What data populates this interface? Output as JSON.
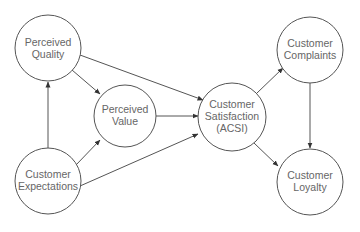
{
  "diagram": {
    "nodes": [
      {
        "id": "perceived_quality",
        "lines": [
          "Perceived",
          "Quality"
        ]
      },
      {
        "id": "perceived_value",
        "lines": [
          "Perceived",
          "Value"
        ]
      },
      {
        "id": "customer_expectations",
        "lines": [
          "Customer",
          "Expectations"
        ]
      },
      {
        "id": "customer_satisfaction",
        "lines": [
          "Customer",
          "Satisfaction",
          "(ACSI)"
        ]
      },
      {
        "id": "customer_complaints",
        "lines": [
          "Customer",
          "Complaints"
        ]
      },
      {
        "id": "customer_loyalty",
        "lines": [
          "Customer",
          "Loyalty"
        ]
      }
    ],
    "edges": [
      {
        "from": "perceived_quality",
        "to": "perceived_value"
      },
      {
        "from": "perceived_quality",
        "to": "customer_satisfaction"
      },
      {
        "from": "customer_expectations",
        "to": "perceived_quality"
      },
      {
        "from": "customer_expectations",
        "to": "perceived_value"
      },
      {
        "from": "customer_expectations",
        "to": "customer_satisfaction"
      },
      {
        "from": "perceived_value",
        "to": "customer_satisfaction"
      },
      {
        "from": "customer_satisfaction",
        "to": "customer_complaints"
      },
      {
        "from": "customer_satisfaction",
        "to": "customer_loyalty"
      },
      {
        "from": "customer_complaints",
        "to": "customer_loyalty"
      }
    ],
    "colors": {
      "stroke": "#555555",
      "text": "#666666",
      "background": "#ffffff"
    }
  }
}
